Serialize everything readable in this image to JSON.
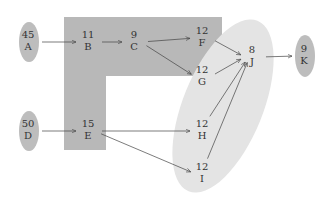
{
  "diagram": {
    "type": "network",
    "nodes": [
      {
        "id": "A",
        "value": "45",
        "x": 28,
        "y": 42,
        "style": "ellipse"
      },
      {
        "id": "B",
        "value": "11",
        "x": 88,
        "y": 42,
        "style": "plain"
      },
      {
        "id": "C",
        "value": "9",
        "x": 134,
        "y": 42,
        "style": "plain"
      },
      {
        "id": "F",
        "value": "12",
        "x": 202,
        "y": 38,
        "style": "plain"
      },
      {
        "id": "G",
        "value": "12",
        "x": 202,
        "y": 77,
        "style": "plain"
      },
      {
        "id": "J",
        "value": "8",
        "x": 252,
        "y": 57,
        "style": "plain"
      },
      {
        "id": "K",
        "value": "9",
        "x": 304,
        "y": 56,
        "style": "ellipse"
      },
      {
        "id": "D",
        "value": "50",
        "x": 28,
        "y": 131,
        "style": "ellipse"
      },
      {
        "id": "E",
        "value": "15",
        "x": 88,
        "y": 131,
        "style": "plain"
      },
      {
        "id": "H",
        "value": "12",
        "x": 202,
        "y": 131,
        "style": "plain"
      },
      {
        "id": "I",
        "value": "12",
        "x": 202,
        "y": 174,
        "style": "plain"
      }
    ],
    "edges": [
      {
        "from": "A",
        "to": "B"
      },
      {
        "from": "B",
        "to": "C"
      },
      {
        "from": "C",
        "to": "F"
      },
      {
        "from": "C",
        "to": "G"
      },
      {
        "from": "F",
        "to": "J"
      },
      {
        "from": "G",
        "to": "J"
      },
      {
        "from": "H",
        "to": "J"
      },
      {
        "from": "I",
        "to": "J"
      },
      {
        "from": "J",
        "to": "K"
      },
      {
        "from": "D",
        "to": "E"
      },
      {
        "from": "E",
        "to": "H"
      },
      {
        "from": "E",
        "to": "I"
      }
    ],
    "colors": {
      "l_region": "#b8b8b8",
      "ellipse_region": "#e4e4e4",
      "node_ellipse": "#bdbdbd",
      "edge": "#444444",
      "text": "#333333"
    }
  }
}
